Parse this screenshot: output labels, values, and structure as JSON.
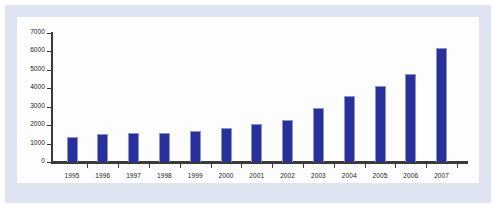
{
  "chart_data": {
    "type": "bar",
    "title": "",
    "subtitle": "",
    "xlabel": "",
    "ylabel": "",
    "categories": [
      "1995",
      "1996",
      "1997",
      "1998",
      "1999",
      "2000",
      "2001",
      "2002",
      "2003",
      "2004",
      "2005",
      "2006",
      "2007"
    ],
    "values": [
      1350,
      1540,
      1570,
      1600,
      1700,
      1850,
      2080,
      2300,
      2950,
      3600,
      4150,
      4800,
      6200
    ],
    "series": [
      {
        "name": "",
        "values": [
          1350,
          1540,
          1570,
          1600,
          1700,
          1850,
          2080,
          2300,
          2950,
          3600,
          4150,
          4800,
          6200
        ]
      }
    ],
    "ylim": [
      0,
      7000
    ],
    "y_ticks": [
      0,
      1000,
      2000,
      3000,
      4000,
      5000,
      6000,
      7000
    ],
    "y_tick_labels": [
      "0",
      "1000",
      "2000",
      "3000",
      "4000",
      "5000",
      "6000",
      "7000"
    ],
    "grid": false,
    "legend": null,
    "legend_position": "none",
    "annotations": [],
    "bar_color": "#27309b",
    "bar_edge_color": "#8d93c4",
    "axis_color": "#3a3a3a",
    "panel_background": "#fdfdfd",
    "frame_background": "#dfe5f0"
  }
}
